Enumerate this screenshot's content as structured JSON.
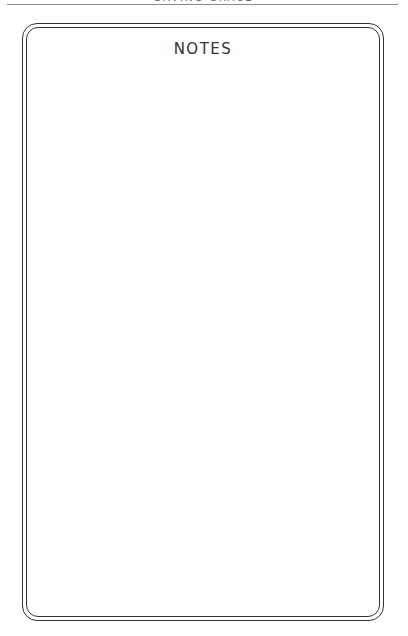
{
  "page": {
    "running_head": "SAVING GRACE",
    "notes_title": "NOTES"
  }
}
